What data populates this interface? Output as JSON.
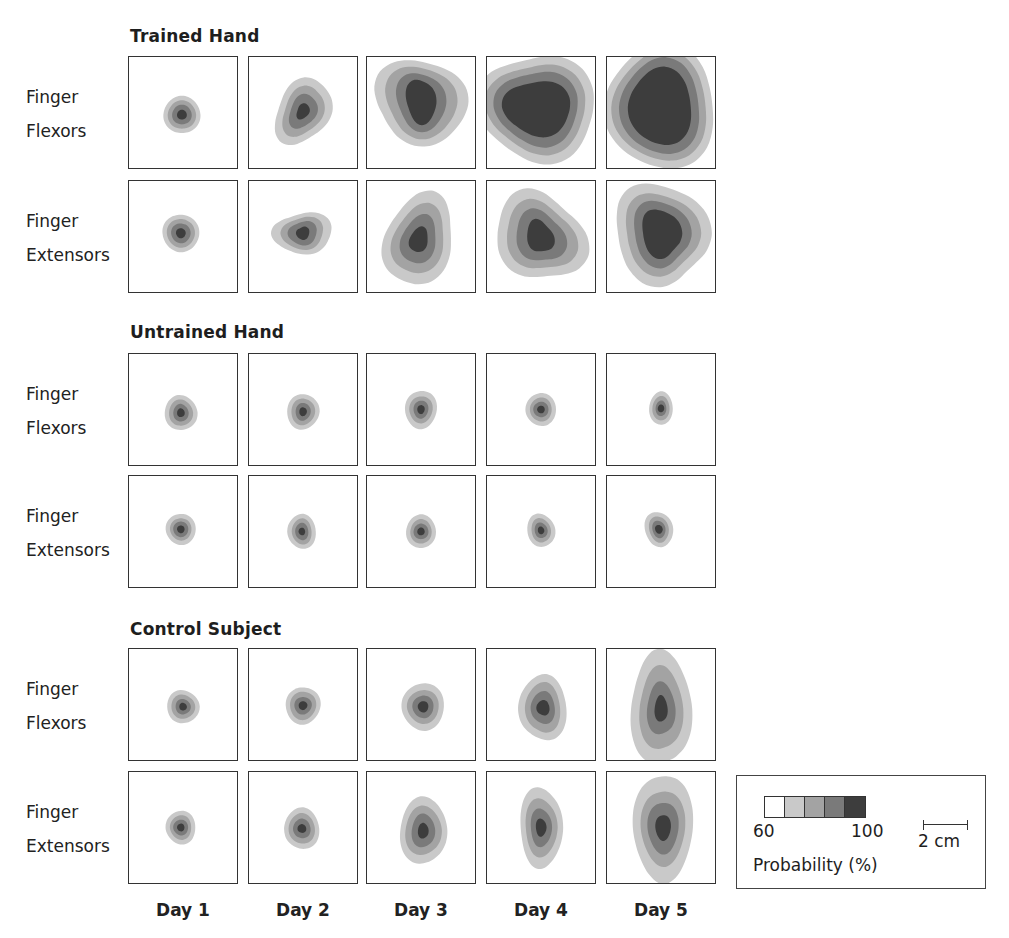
{
  "figure": {
    "sections": [
      {
        "title": "Trained Hand",
        "rows": [
          {
            "label_lines": [
              "Finger",
              "Flexors"
            ],
            "maps": [
              {
                "day": "Day 1",
                "center": [
                  0.49,
                  0.52
                ],
                "rx": [
                  0.17,
                  0.13,
                  0.09,
                  0.045
                ],
                "ry": [
                  0.17,
                  0.13,
                  0.09,
                  0.045
                ],
                "skew": 0,
                "irregular": 0.02
              },
              {
                "day": "Day 2",
                "center": [
                  0.5,
                  0.49
                ],
                "rx": [
                  0.26,
                  0.19,
                  0.13,
                  0.06
                ],
                "ry": [
                  0.29,
                  0.22,
                  0.15,
                  0.07
                ],
                "skew": -0.35,
                "irregular": 0.08
              },
              {
                "day": "Day 3",
                "center": [
                  0.5,
                  0.4
                ],
                "rx": [
                  0.43,
                  0.33,
                  0.23,
                  0.14
                ],
                "ry": [
                  0.38,
                  0.32,
                  0.26,
                  0.2
                ],
                "skew": 0.1,
                "irregular": 0.07
              },
              {
                "day": "Day 4",
                "center": [
                  0.47,
                  0.46
                ],
                "rx": [
                  0.52,
                  0.44,
                  0.37,
                  0.3
                ],
                "ry": [
                  0.5,
                  0.42,
                  0.35,
                  0.26
                ],
                "skew": 0.15,
                "irregular": 0.08
              },
              {
                "day": "Day 5",
                "center": [
                  0.5,
                  0.45
                ],
                "rx": [
                  0.52,
                  0.45,
                  0.38,
                  0.3
                ],
                "ry": [
                  0.55,
                  0.48,
                  0.42,
                  0.34
                ],
                "skew": 0.1,
                "irregular": 0.06
              }
            ]
          },
          {
            "label_lines": [
              "Finger",
              "Extensors"
            ],
            "maps": [
              {
                "day": "Day 1",
                "center": [
                  0.48,
                  0.47
                ],
                "rx": [
                  0.17,
                  0.13,
                  0.09,
                  0.045
                ],
                "ry": [
                  0.17,
                  0.13,
                  0.09,
                  0.045
                ],
                "skew": 0,
                "irregular": 0.02
              },
              {
                "day": "Day 2",
                "center": [
                  0.5,
                  0.47
                ],
                "rx": [
                  0.27,
                  0.19,
                  0.13,
                  0.06
                ],
                "ry": [
                  0.19,
                  0.15,
                  0.11,
                  0.06
                ],
                "skew": 0,
                "irregular": 0.08
              },
              {
                "day": "Day 3",
                "center": [
                  0.48,
                  0.53
                ],
                "rx": [
                  0.33,
                  0.25,
                  0.17,
                  0.09
                ],
                "ry": [
                  0.4,
                  0.3,
                  0.21,
                  0.11
                ],
                "skew": -0.3,
                "irregular": 0.08
              },
              {
                "day": "Day 4",
                "center": [
                  0.49,
                  0.5
                ],
                "rx": [
                  0.4,
                  0.31,
                  0.22,
                  0.12
                ],
                "ry": [
                  0.41,
                  0.32,
                  0.24,
                  0.15
                ],
                "skew": 0.2,
                "irregular": 0.1
              },
              {
                "day": "Day 5",
                "center": [
                  0.5,
                  0.47
                ],
                "rx": [
                  0.43,
                  0.34,
                  0.26,
                  0.18
                ],
                "ry": [
                  0.46,
                  0.37,
                  0.3,
                  0.22
                ],
                "skew": 0.3,
                "irregular": 0.09
              }
            ]
          }
        ]
      },
      {
        "title": "Untrained Hand",
        "rows": [
          {
            "label_lines": [
              "Finger",
              "Flexors"
            ],
            "maps": [
              {
                "day": "Day 1",
                "center": [
                  0.48,
                  0.53
                ],
                "rx": [
                  0.15,
                  0.11,
                  0.07,
                  0.035
                ],
                "ry": [
                  0.16,
                  0.12,
                  0.08,
                  0.04
                ],
                "skew": 0,
                "irregular": 0.03
              },
              {
                "day": "Day 2",
                "center": [
                  0.5,
                  0.52
                ],
                "rx": [
                  0.15,
                  0.11,
                  0.07,
                  0.035
                ],
                "ry": [
                  0.16,
                  0.12,
                  0.08,
                  0.04
                ],
                "skew": 0,
                "irregular": 0.03
              },
              {
                "day": "Day 3",
                "center": [
                  0.5,
                  0.5
                ],
                "rx": [
                  0.15,
                  0.11,
                  0.07,
                  0.035
                ],
                "ry": [
                  0.17,
                  0.12,
                  0.08,
                  0.04
                ],
                "skew": -0.1,
                "irregular": 0.03
              },
              {
                "day": "Day 4",
                "center": [
                  0.5,
                  0.5
                ],
                "rx": [
                  0.14,
                  0.1,
                  0.07,
                  0.035
                ],
                "ry": [
                  0.15,
                  0.11,
                  0.07,
                  0.035
                ],
                "skew": 0,
                "irregular": 0.02
              },
              {
                "day": "Day 5",
                "center": [
                  0.5,
                  0.49
                ],
                "rx": [
                  0.11,
                  0.08,
                  0.05,
                  0.03
                ],
                "ry": [
                  0.15,
                  0.11,
                  0.07,
                  0.035
                ],
                "skew": 0,
                "irregular": 0.02
              }
            ]
          },
          {
            "label_lines": [
              "Finger",
              "Extensors"
            ],
            "maps": [
              {
                "day": "Day 1",
                "center": [
                  0.48,
                  0.48
                ],
                "rx": [
                  0.14,
                  0.1,
                  0.07,
                  0.035
                ],
                "ry": [
                  0.14,
                  0.1,
                  0.07,
                  0.035
                ],
                "skew": 0,
                "irregular": 0.02
              },
              {
                "day": "Day 2",
                "center": [
                  0.49,
                  0.5
                ],
                "rx": [
                  0.13,
                  0.09,
                  0.06,
                  0.03
                ],
                "ry": [
                  0.16,
                  0.12,
                  0.08,
                  0.035
                ],
                "skew": 0.1,
                "irregular": 0.03
              },
              {
                "day": "Day 3",
                "center": [
                  0.5,
                  0.5
                ],
                "rx": [
                  0.14,
                  0.1,
                  0.07,
                  0.035
                ],
                "ry": [
                  0.15,
                  0.11,
                  0.07,
                  0.035
                ],
                "skew": 0,
                "irregular": 0.02
              },
              {
                "day": "Day 4",
                "center": [
                  0.5,
                  0.49
                ],
                "rx": [
                  0.13,
                  0.09,
                  0.06,
                  0.03
                ],
                "ry": [
                  0.15,
                  0.11,
                  0.07,
                  0.035
                ],
                "skew": 0.1,
                "irregular": 0.03
              },
              {
                "day": "Day 5",
                "center": [
                  0.48,
                  0.48
                ],
                "rx": [
                  0.13,
                  0.09,
                  0.06,
                  0.035
                ],
                "ry": [
                  0.16,
                  0.12,
                  0.08,
                  0.04
                ],
                "skew": 0.25,
                "irregular": 0.03
              }
            ]
          }
        ]
      },
      {
        "title": "Control Subject",
        "rows": [
          {
            "label_lines": [
              "Finger",
              "Flexors"
            ],
            "maps": [
              {
                "day": "Day 1",
                "center": [
                  0.5,
                  0.52
                ],
                "rx": [
                  0.15,
                  0.11,
                  0.07,
                  0.035
                ],
                "ry": [
                  0.15,
                  0.11,
                  0.07,
                  0.035
                ],
                "skew": 0,
                "irregular": 0.03
              },
              {
                "day": "Day 2",
                "center": [
                  0.5,
                  0.51
                ],
                "rx": [
                  0.16,
                  0.12,
                  0.08,
                  0.04
                ],
                "ry": [
                  0.17,
                  0.13,
                  0.08,
                  0.04
                ],
                "skew": 0,
                "irregular": 0.03
              },
              {
                "day": "Day 3",
                "center": [
                  0.52,
                  0.52
                ],
                "rx": [
                  0.2,
                  0.15,
                  0.1,
                  0.05
                ],
                "ry": [
                  0.21,
                  0.15,
                  0.1,
                  0.05
                ],
                "skew": 0,
                "irregular": 0.03
              },
              {
                "day": "Day 4",
                "center": [
                  0.52,
                  0.53
                ],
                "rx": [
                  0.22,
                  0.16,
                  0.11,
                  0.06
                ],
                "ry": [
                  0.3,
                  0.23,
                  0.15,
                  0.07
                ],
                "skew": 0,
                "irregular": 0.05
              },
              {
                "day": "Day 5",
                "center": [
                  0.5,
                  0.54
                ],
                "rx": [
                  0.28,
                  0.2,
                  0.13,
                  0.06
                ],
                "ry": [
                  0.52,
                  0.38,
                  0.24,
                  0.12
                ],
                "skew": 0.05,
                "irregular": 0.06
              }
            ]
          },
          {
            "label_lines": [
              "Finger",
              "Extensors"
            ],
            "maps": [
              {
                "day": "Day 1",
                "center": [
                  0.48,
                  0.5
                ],
                "rx": [
                  0.14,
                  0.1,
                  0.07,
                  0.035
                ],
                "ry": [
                  0.15,
                  0.11,
                  0.07,
                  0.035
                ],
                "skew": 0,
                "irregular": 0.03
              },
              {
                "day": "Day 2",
                "center": [
                  0.49,
                  0.51
                ],
                "rx": [
                  0.16,
                  0.12,
                  0.08,
                  0.04
                ],
                "ry": [
                  0.19,
                  0.14,
                  0.09,
                  0.04
                ],
                "skew": 0.05,
                "irregular": 0.03
              },
              {
                "day": "Day 3",
                "center": [
                  0.52,
                  0.53
                ],
                "rx": [
                  0.22,
                  0.17,
                  0.11,
                  0.05
                ],
                "ry": [
                  0.3,
                  0.22,
                  0.15,
                  0.07
                ],
                "skew": 0,
                "irregular": 0.04
              },
              {
                "day": "Day 4",
                "center": [
                  0.5,
                  0.5
                ],
                "rx": [
                  0.2,
                  0.15,
                  0.1,
                  0.05
                ],
                "ry": [
                  0.36,
                  0.26,
                  0.17,
                  0.08
                ],
                "skew": 0,
                "irregular": 0.05
              },
              {
                "day": "Day 5",
                "center": [
                  0.52,
                  0.5
                ],
                "rx": [
                  0.27,
                  0.2,
                  0.14,
                  0.07
                ],
                "ry": [
                  0.5,
                  0.35,
                  0.24,
                  0.12
                ],
                "skew": 0,
                "irregular": 0.05
              }
            ]
          }
        ]
      }
    ],
    "day_labels": [
      "Day 1",
      "Day 2",
      "Day 3",
      "Day 4",
      "Day 5"
    ]
  },
  "legend": {
    "swatch_colors": [
      "#ffffff",
      "#c9c9c9",
      "#a3a3a3",
      "#7a7a7a",
      "#3d3d3d"
    ],
    "min_label": "60",
    "max_label": "100",
    "title": "Probability (%)",
    "scale_label": "2 cm"
  },
  "contour_colors": [
    "#c9c9c9",
    "#a3a3a3",
    "#7a7a7a",
    "#3d3d3d"
  ]
}
